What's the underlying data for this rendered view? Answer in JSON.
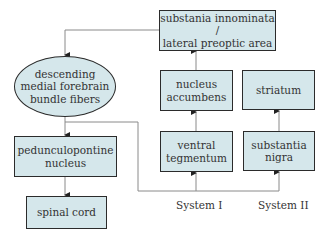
{
  "nodes": {
    "substantia_innominata": "substania innominata /\nlateral preoptic area",
    "mfb": "descending\nmedial forebrain\nbundle fibers",
    "nucleus_accumbens": "nucleus\naccumbens",
    "striatum": "striatum",
    "pedunculopontine": "pedunculopontine\nnucleus",
    "ventral_tegmentum": "ventral\ntegmentum",
    "substantia_nigra": "substantia\nnigra",
    "spinal_cord": "spinal cord"
  },
  "labels": {
    "system_1": "System I",
    "system_2": "System II"
  },
  "colors": {
    "node_fill": "#d5e7eb",
    "node_border": "#2b2b2b",
    "line": "#888888"
  }
}
